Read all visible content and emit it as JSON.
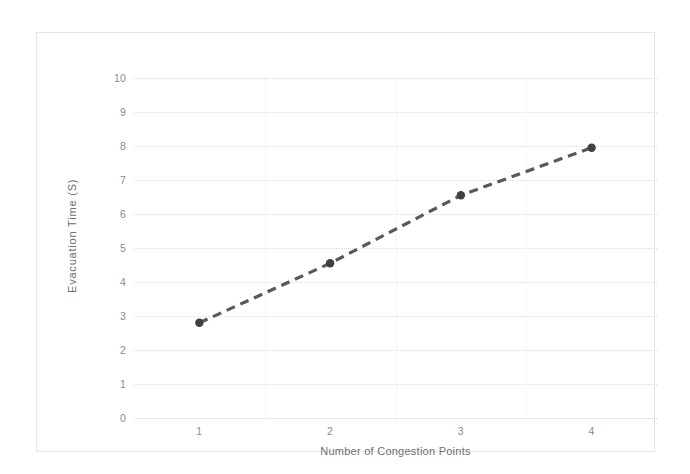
{
  "chart_data": {
    "type": "line",
    "title": "",
    "xlabel": "Number of Congestion Points",
    "ylabel": "Evacuation Time (S)",
    "categories": [
      "1",
      "2",
      "3",
      "4"
    ],
    "x": [
      1,
      2,
      3,
      4
    ],
    "values": [
      2.8,
      4.55,
      6.55,
      7.95
    ],
    "series": [
      {
        "name": "Evacuation Time",
        "values": [
          2.8,
          4.55,
          6.55,
          7.95
        ],
        "line_style": "dashed",
        "line_color": "#595959",
        "marker": "circle",
        "marker_color": "#404040"
      }
    ],
    "ylim": [
      0,
      10
    ],
    "ytick_labels": [
      "0",
      "1",
      "2",
      "3",
      "4",
      "5",
      "6",
      "7",
      "8",
      "9",
      "10"
    ],
    "ytick_values": [
      0,
      1,
      2,
      3,
      4,
      5,
      6,
      7,
      8,
      9,
      10
    ],
    "xtick_labels": [
      "1",
      "2",
      "3",
      "4"
    ],
    "grid": "horizontal-dotted",
    "legend": "none",
    "legend_position": "none",
    "background_color": "#ffffff",
    "grid_color": "#dcdcdc",
    "axis_label_color": "#6e6e6e",
    "tick_label_color": "#8c8c8c",
    "frame_color": "#e6e6e6"
  }
}
